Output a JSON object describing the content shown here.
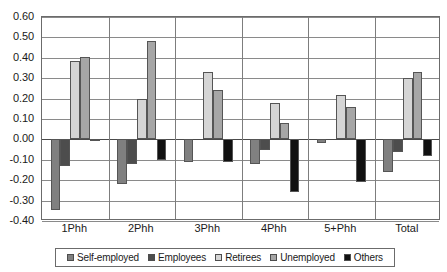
{
  "chart_data": {
    "type": "bar",
    "title": "",
    "subtitle": "",
    "xlabel": "",
    "ylabel": "",
    "categories": [
      "1Phh",
      "2Phh",
      "3Phh",
      "4Phh",
      "5+Phh",
      "Total"
    ],
    "series": [
      {
        "name": "Self-employed",
        "color": "#808080",
        "values": [
          -0.345,
          -0.22,
          -0.11,
          -0.12,
          -0.02,
          -0.16
        ]
      },
      {
        "name": "Employees",
        "color": "#4d4d4d",
        "values": [
          -0.13,
          -0.12,
          0.0,
          -0.05,
          0.0,
          -0.06
        ]
      },
      {
        "name": "Retirees",
        "color": "#d5d5d5",
        "values": [
          0.385,
          0.2,
          0.33,
          0.18,
          0.22,
          0.3
        ]
      },
      {
        "name": "Unemployed",
        "color": "#a6a6a6",
        "values": [
          0.405,
          0.48,
          0.24,
          0.08,
          0.16,
          0.33
        ]
      },
      {
        "name": "Others",
        "color": "#111111",
        "values": [
          -0.01,
          -0.1,
          -0.11,
          -0.26,
          -0.21,
          -0.08
        ]
      }
    ],
    "ylim": [
      -0.4,
      0.6
    ],
    "ytick_step": 0.1,
    "yticks": [
      "0.60",
      "0.50",
      "0.40",
      "0.30",
      "0.20",
      "0.10",
      "0.00",
      "-0.10",
      "-0.20",
      "-0.30",
      "-0.40"
    ],
    "ytick_values": [
      0.6,
      0.5,
      0.4,
      0.3,
      0.2,
      0.1,
      0.0,
      -0.1,
      -0.2,
      -0.3,
      -0.4
    ],
    "grid": true,
    "legend_position": "bottom",
    "axis_color": "#6b6b6b",
    "grid_color": "#8a8a8a",
    "background": "#ffffff"
  },
  "legend": {
    "items": [
      {
        "label": "Self-employed",
        "swatch_icon": "legend-swatch-icon"
      },
      {
        "label": "Employees",
        "swatch_icon": "legend-swatch-icon"
      },
      {
        "label": "Retirees",
        "swatch_icon": "legend-swatch-icon"
      },
      {
        "label": "Unemployed",
        "swatch_icon": "legend-swatch-icon"
      },
      {
        "label": "Others",
        "swatch_icon": "legend-swatch-icon"
      }
    ]
  }
}
